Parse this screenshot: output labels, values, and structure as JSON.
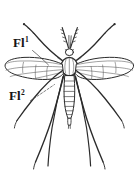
{
  "figure": {
    "background_color": "#ffffff",
    "ink_color": "#1a1a1a",
    "line_color": "#333333",
    "width": 138,
    "height": 170,
    "style": "engraved line drawing"
  },
  "labels": [
    {
      "id": "fl1",
      "text": "Fl",
      "superscript": "1",
      "full_text": "Fl1",
      "x": 13,
      "y": 36,
      "leader_to": "left forewing base"
    },
    {
      "id": "fl2",
      "text": "Fl",
      "superscript": "2",
      "full_text": "Fl2",
      "x": 9,
      "y": 89,
      "leader_to": "left hindwing / halter region"
    }
  ],
  "anatomy": {
    "head": "small head with palps at top centre",
    "antennae": "pair of slender segmented antennae forming a V above the head",
    "thorax": "oval thorax at centre with radiating setae",
    "abdomen": "elongate abdomen of eight tapering segments ending in terminalia",
    "wings": "one pair of broad membranous wings with longitudinal venation, held outstretched",
    "legs": "three pairs of very long slender legs; forelegs raised upward, mid and hind legs sweeping downward"
  }
}
